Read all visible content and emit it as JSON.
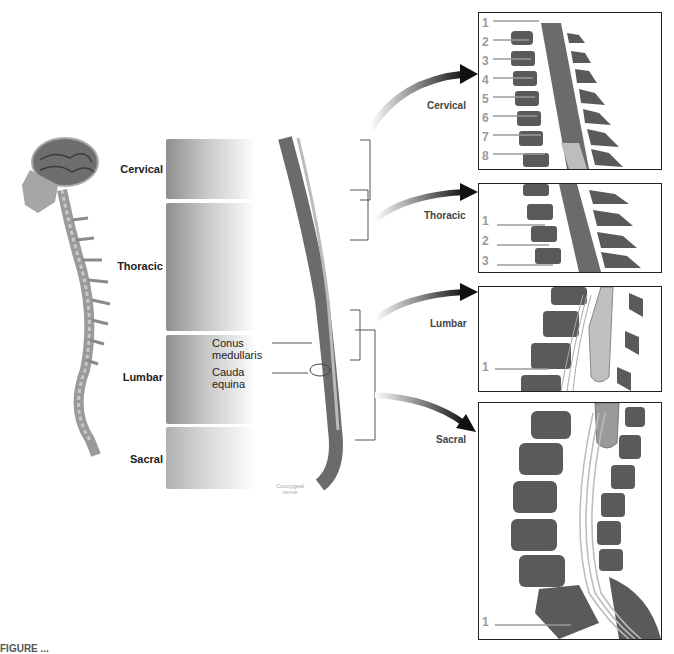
{
  "figure": {
    "caption_visible": "FIGURE ...",
    "regions": [
      {
        "name": "Cervical"
      },
      {
        "name": "Thoracic"
      },
      {
        "name": "Lumbar"
      },
      {
        "name": "Sacral"
      }
    ],
    "annotations": {
      "conus": [
        "Conus",
        "medullaris"
      ],
      "cauda": [
        "Cauda",
        "equina"
      ],
      "coccygeal": [
        "Coccygeal",
        "nerve"
      ]
    },
    "middle_spine": {
      "cervical_ticks": [
        "1",
        "2",
        "3",
        "4",
        "5",
        "6",
        "7",
        "8"
      ],
      "thoracic_ticks": [
        "1",
        "2",
        "3",
        "4",
        "5",
        "6",
        "7",
        "8",
        "9",
        "10",
        "11",
        "12"
      ],
      "lumbar_ticks": [
        "1",
        "2",
        "3",
        "4",
        "5"
      ],
      "sacral_ticks": [
        "1",
        "2",
        "3",
        "4",
        "5"
      ]
    },
    "insets": {
      "cervical": {
        "title": "Cervical",
        "nerve_labels": [
          "1",
          "2",
          "3",
          "4",
          "5",
          "6",
          "7",
          "8"
        ],
        "body_labels": [
          "1",
          "2",
          "3",
          "4",
          "5",
          "6",
          "7",
          "1"
        ],
        "cord_labels": [
          "1",
          "2",
          "3",
          "4",
          "5",
          "6",
          "7",
          "8"
        ],
        "spinous_labels": [
          "1",
          "2",
          "3",
          "4",
          "5",
          "6",
          "7",
          "1"
        ]
      },
      "thoracic": {
        "title": "Thoracic",
        "nerve_labels": [
          "1",
          "2",
          "3"
        ],
        "body_labels": [
          "1",
          "2",
          "3",
          "4"
        ],
        "cord_labels": [
          "1",
          "2",
          "3",
          "4",
          "5"
        ],
        "spinous_labels": [
          "1",
          "2",
          "3",
          "4"
        ]
      },
      "lumbar": {
        "title": "Lumbar",
        "nerve_labels": [
          "1"
        ],
        "body_labels": [
          "1",
          "2"
        ],
        "cord_labels": [
          "1",
          "2",
          "3",
          "4",
          "5"
        ],
        "spinous_labels": [
          "1"
        ]
      },
      "sacral": {
        "title": "Sacral",
        "nerve_labels": [
          "1"
        ],
        "body_labels": [
          "1",
          "2"
        ],
        "cord_labels": [
          "1",
          "2",
          "3",
          "4",
          "5"
        ]
      }
    },
    "colors": {
      "vertebra": "#5a5a5a",
      "cord": "#8a8a8a",
      "nerve_label": "#9a9a9a",
      "frame": "#222222"
    }
  }
}
